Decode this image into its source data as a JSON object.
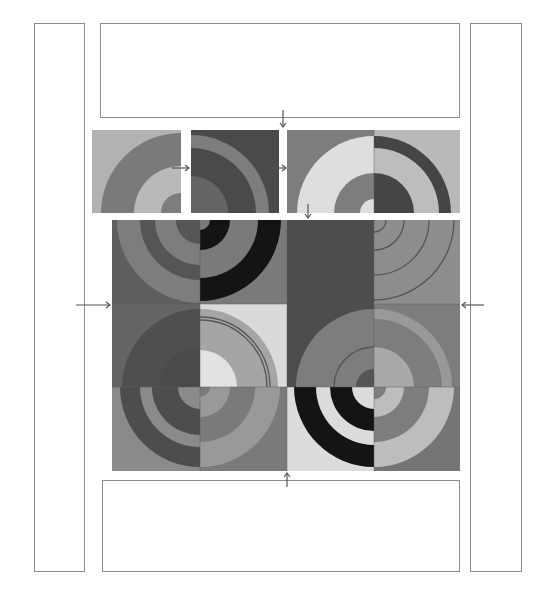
{
  "diagram": {
    "title": "",
    "colors": {
      "black": "#141414",
      "dark": "#4a4a4a",
      "mid_dark": "#656565",
      "mid": "#7d7d7d",
      "mid_light": "#999999",
      "light": "#b9b9b9",
      "pale": "#dedede",
      "outline": "#8a8a8a",
      "arrow": "#555555"
    },
    "borders": [
      {
        "id": "left-border",
        "x": 34,
        "y": 23,
        "w": 51,
        "h": 549
      },
      {
        "id": "right-border",
        "x": 470,
        "y": 23,
        "w": 52,
        "h": 549
      },
      {
        "id": "top-border",
        "x": 100,
        "y": 23,
        "w": 360,
        "h": 95
      },
      {
        "id": "bottom-border",
        "x": 102,
        "y": 480,
        "w": 358,
        "h": 92
      }
    ],
    "top_row": {
      "tiles": [
        {
          "id": "top-1",
          "x": 92,
          "y": 130,
          "w": 89,
          "h": 83,
          "bg": "#b2b2b2",
          "cx": 89,
          "cy": 83,
          "rings": [
            {
              "r": 80,
              "c": "#7a7a7a"
            },
            {
              "r": 47,
              "c": "#b9b9b9"
            },
            {
              "r": 20,
              "c": "#7d7d7d"
            }
          ]
        },
        {
          "id": "top-2",
          "x": 191,
          "y": 130,
          "w": 88,
          "h": 83,
          "bg": "#4a4a4a",
          "cx": 0,
          "cy": 83,
          "rings": [
            {
              "r": 78,
              "c": "#7d7d7d"
            },
            {
              "r": 65,
              "c": "#4a4a4a"
            },
            {
              "r": 37,
              "c": "#656565"
            }
          ]
        },
        {
          "id": "top-3",
          "x": 287,
          "y": 130,
          "w": 87,
          "h": 83,
          "bg": "#7d7d7d",
          "cx": 87,
          "cy": 83,
          "rings": [
            {
              "r": 77,
              "c": "#dedede"
            },
            {
              "r": 40,
              "c": "#7d7d7d"
            },
            {
              "r": 14,
              "c": "#dedede"
            }
          ]
        },
        {
          "id": "top-4",
          "x": 374,
          "y": 130,
          "w": 86,
          "h": 83,
          "bg": "#b9b9b9",
          "cx": 0,
          "cy": 83,
          "rings": [
            {
              "r": 77,
              "c": "#454545"
            },
            {
              "r": 65,
              "c": "#bdbdbd"
            },
            {
              "r": 40,
              "c": "#454545"
            }
          ]
        }
      ]
    },
    "main_grid": {
      "rows": [
        {
          "tiles": [
            {
              "id": "r1-c1",
              "x": 112,
              "y": 220,
              "w": 88,
              "h": 84,
              "bg": "#5e5e5e",
              "cx": 88,
              "cy": 0,
              "rings": [
                {
                  "r": 83,
                  "c": "#7d7d7d"
                },
                {
                  "r": 60,
                  "c": "#555555"
                },
                {
                  "r": 45,
                  "c": "#7d7d7d"
                },
                {
                  "r": 24,
                  "c": "#555555"
                }
              ]
            },
            {
              "id": "r1-c2",
              "x": 200,
              "y": 220,
              "w": 87,
              "h": 84,
              "bg": "#7a7a7a",
              "cx": 0,
              "cy": 0,
              "rings": [
                {
                  "r": 81,
                  "c": "#141414"
                },
                {
                  "r": 58,
                  "c": "#7a7a7a"
                },
                {
                  "r": 30,
                  "c": "#141414"
                },
                {
                  "r": 10,
                  "c": "#7a7a7a"
                }
              ]
            },
            {
              "id": "r1-c3",
              "x": 287,
              "y": 220,
              "w": 87,
              "h": 84,
              "bg": "#4d4d4d",
              "cx": 0,
              "cy": 0,
              "rings": []
            },
            {
              "id": "r1-c4",
              "x": 374,
              "y": 220,
              "w": 86,
              "h": 84,
              "bg": "#8d8d8d",
              "cx": 0,
              "cy": 0,
              "outline_rings": [
                {
                  "r": 80
                },
                {
                  "r": 55
                },
                {
                  "r": 30
                },
                {
                  "r": 12
                }
              ]
            }
          ]
        },
        {
          "tiles": [
            {
              "id": "r2-c1",
              "x": 112,
              "y": 304,
              "w": 88,
              "h": 83,
              "bg": "#656565",
              "cx": 88,
              "cy": 83,
              "rings": [
                {
                  "r": 78,
                  "c": "#4f4f4f"
                },
                {
                  "r": 40,
                  "c": "#4a4a4a"
                }
              ]
            },
            {
              "id": "r2-c2",
              "x": 200,
              "y": 304,
              "w": 87,
              "h": 83,
              "bg": "#dadada",
              "cx": 0,
              "cy": 83,
              "rings": [
                {
                  "r": 78,
                  "c": "#a5a5a5"
                },
                {
                  "r": 37,
                  "c": "#e2e2e2"
                }
              ],
              "outline_rings": [
                {
                  "r": 70
                },
                {
                  "r": 67
                }
              ]
            },
            {
              "id": "r2-c3",
              "x": 287,
              "y": 304,
              "w": 87,
              "h": 83,
              "bg": "#4d4d4d",
              "cx": 87,
              "cy": 83,
              "rings": [
                {
                  "r": 78,
                  "c": "#7d7d7d"
                },
                {
                  "r": 40,
                  "c": "#7d7d7d"
                },
                {
                  "r": 18,
                  "c": "#555555"
                }
              ],
              "outline_rings": [
                {
                  "r": 40
                }
              ]
            },
            {
              "id": "r2-c4",
              "x": 374,
              "y": 304,
              "w": 86,
              "h": 83,
              "bg": "#7d7d7d",
              "cx": 0,
              "cy": 83,
              "rings": [
                {
                  "r": 78,
                  "c": "#999999"
                },
                {
                  "r": 68,
                  "c": "#7d7d7d"
                },
                {
                  "r": 40,
                  "c": "#a8a8a8"
                }
              ]
            }
          ]
        },
        {
          "tiles": [
            {
              "id": "r3-c1",
              "x": 112,
              "y": 387,
              "w": 88,
              "h": 84,
              "bg": "#8a8a8a",
              "cx": 88,
              "cy": 0,
              "rings": [
                {
                  "r": 80,
                  "c": "#4d4d4d"
                },
                {
                  "r": 60,
                  "c": "#8a8a8a"
                },
                {
                  "r": 48,
                  "c": "#4d4d4d"
                },
                {
                  "r": 22,
                  "c": "#8a8a8a"
                }
              ]
            },
            {
              "id": "r3-c2",
              "x": 200,
              "y": 387,
              "w": 87,
              "h": 84,
              "bg": "#7a7a7a",
              "cx": 0,
              "cy": 0,
              "rings": [
                {
                  "r": 80,
                  "c": "#999999"
                },
                {
                  "r": 55,
                  "c": "#7a7a7a"
                },
                {
                  "r": 30,
                  "c": "#999999"
                },
                {
                  "r": 10,
                  "c": "#7a7a7a"
                }
              ]
            },
            {
              "id": "r3-c3",
              "x": 287,
              "y": 387,
              "w": 87,
              "h": 84,
              "bg": "#dcdcdc",
              "cx": 87,
              "cy": 0,
              "rings": [
                {
                  "r": 80,
                  "c": "#141414"
                },
                {
                  "r": 58,
                  "c": "#dcdcdc"
                },
                {
                  "r": 44,
                  "c": "#141414"
                },
                {
                  "r": 22,
                  "c": "#dcdcdc"
                }
              ]
            },
            {
              "id": "r3-c4",
              "x": 374,
              "y": 387,
              "w": 86,
              "h": 84,
              "bg": "#757575",
              "cx": 0,
              "cy": 0,
              "rings": [
                {
                  "r": 80,
                  "c": "#bdbdbd"
                },
                {
                  "r": 55,
                  "c": "#7d7d7d"
                },
                {
                  "r": 30,
                  "c": "#bdbdbd"
                },
                {
                  "r": 12,
                  "c": "#7d7d7d"
                }
              ]
            }
          ]
        }
      ]
    },
    "arrows": [
      {
        "id": "arrow-left-in",
        "x1": 76,
        "y1": 305,
        "x2": 110,
        "y2": 305,
        "dir": "right"
      },
      {
        "id": "arrow-right-in",
        "x1": 484,
        "y1": 305,
        "x2": 462,
        "y2": 305,
        "dir": "left"
      },
      {
        "id": "arrow-top-down",
        "x1": 283,
        "y1": 110,
        "x2": 283,
        "y2": 127,
        "dir": "down"
      },
      {
        "id": "arrow-bottom-up",
        "x1": 287,
        "y1": 487,
        "x2": 287,
        "y2": 473,
        "dir": "up"
      },
      {
        "id": "arrow-mid-down",
        "x1": 308,
        "y1": 204,
        "x2": 308,
        "y2": 218,
        "dir": "down"
      },
      {
        "id": "arrow-join-1",
        "x1": 172,
        "y1": 168,
        "x2": 189,
        "y2": 168,
        "dir": "right"
      },
      {
        "id": "arrow-join-2",
        "x1": 269,
        "y1": 168,
        "x2": 286,
        "y2": 168,
        "dir": "right"
      }
    ]
  }
}
